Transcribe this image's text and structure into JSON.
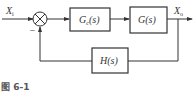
{
  "diagram": {
    "type": "block-diagram",
    "input": {
      "label": "X",
      "subscript": "i"
    },
    "output": {
      "label": "X",
      "subscript": "o"
    },
    "summing_junction": {
      "sign_feedback": "−"
    },
    "blocks": [
      {
        "id": "controller",
        "label": "G",
        "subscript": "c",
        "arg": "(s)"
      },
      {
        "id": "plant",
        "label": "G",
        "subscript": "",
        "arg": "(s)"
      },
      {
        "id": "feedback",
        "label": "H",
        "subscript": "",
        "arg": "(s)"
      }
    ],
    "caption": "图 6-1"
  }
}
